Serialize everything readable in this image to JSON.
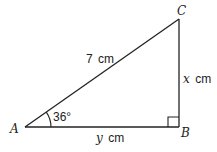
{
  "diagram": {
    "type": "right-triangle",
    "vertices": {
      "A": {
        "label": "A"
      },
      "B": {
        "label": "B"
      },
      "C": {
        "label": "C"
      }
    },
    "sides": {
      "hypotenuse_AC": {
        "length": "7",
        "unit": "cm"
      },
      "BC": {
        "variable": "x",
        "unit": "cm"
      },
      "AB": {
        "variable": "y",
        "unit": "cm"
      }
    },
    "angle_A": {
      "value": "36°"
    },
    "right_angle_at": "B"
  }
}
